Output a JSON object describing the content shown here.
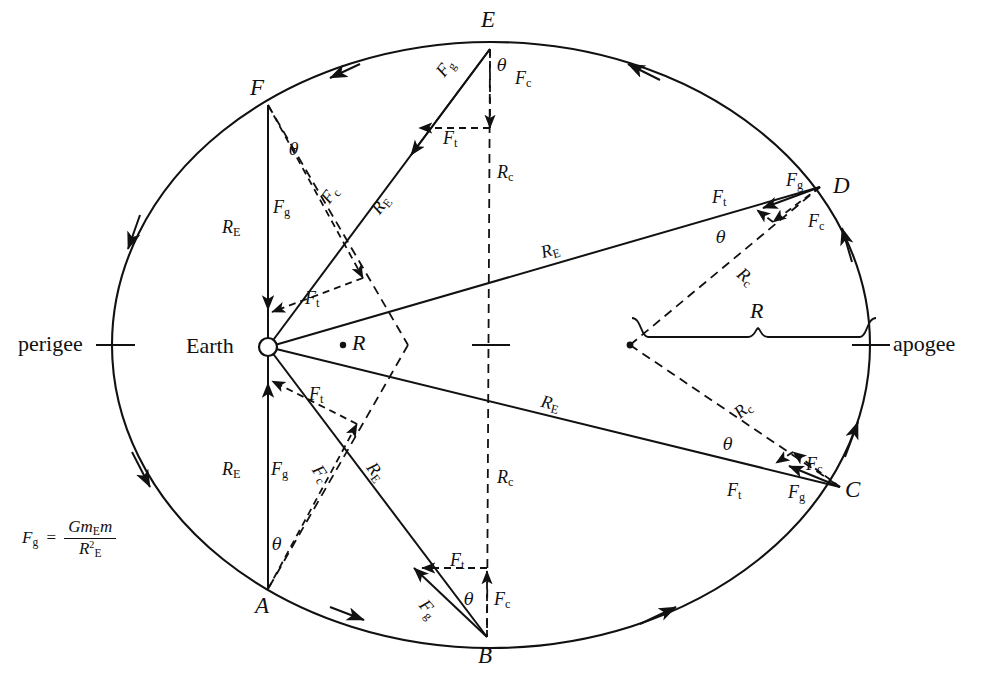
{
  "figure": {
    "type": "physics-orbit-diagram",
    "background": "#ffffff",
    "ink": "#111111"
  },
  "orbit": {
    "shape": "ellipse",
    "center": {
      "x": 491,
      "y": 345
    },
    "semi_major_x": 379,
    "semi_minor_y": 303,
    "direction": "counterclockwise",
    "perigee_label": "perigee",
    "apogee_label": "apogee",
    "perigee_tick": {
      "x": 112,
      "y": 345
    },
    "apogee_tick": {
      "x": 870,
      "y": 345
    },
    "center_tick": {
      "x": 491,
      "y": 345
    }
  },
  "earth": {
    "label": "Earth",
    "x": 268,
    "y": 347,
    "radius": 9
  },
  "focus_dot": {
    "x": 630,
    "y": 345
  },
  "center_dot_label": {
    "text": "R",
    "x": 355,
    "y": 345
  },
  "brace": {
    "label": "R",
    "from_x": 630,
    "to_x": 870,
    "y": 337,
    "label_x": 758,
    "label_y": 313
  },
  "points": [
    {
      "name": "A",
      "x": 268,
      "y": 589,
      "label_x": 259,
      "label_y": 600
    },
    {
      "name": "B",
      "x": 487,
      "y": 637,
      "label_x": 478,
      "label_y": 648
    },
    {
      "name": "C",
      "x": 840,
      "y": 487,
      "label_x": 843,
      "label_y": 479
    },
    {
      "name": "D",
      "x": 820,
      "y": 187,
      "label_x": 833,
      "label_y": 178
    },
    {
      "name": "E",
      "x": 490,
      "y": 49,
      "label_x": 481,
      "label_y": 12
    },
    {
      "name": "F",
      "x": 268,
      "y": 105,
      "label_x": 254,
      "label_y": 78
    }
  ],
  "labels": {
    "F_g": "F",
    "F_g_sub": "g",
    "F_c": "F",
    "F_c_sub": "c",
    "F_t": "F",
    "F_t_sub": "t",
    "R_E": "R",
    "R_E_sub": "E",
    "R_c": "R",
    "R_c_sub": "c",
    "theta": "θ",
    "R": "R"
  },
  "formula": {
    "lhs": "F",
    "lhs_sub": "g",
    "equals": "=",
    "numerator_Gm": "Gm",
    "numerator_sub": "E",
    "numerator_m": "m",
    "denominator_R": "R",
    "denominator_sup": "2",
    "denominator_sub": "E",
    "x": 22,
    "y": 520
  },
  "annotations": {
    "F_labels_count": 18,
    "theta_count": 6,
    "R_E_count": 6,
    "R_c_count": 4
  }
}
